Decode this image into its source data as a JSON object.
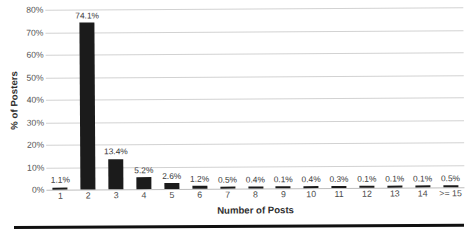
{
  "chart_data": {
    "type": "bar",
    "title": "",
    "xlabel": "Number of Posts",
    "ylabel": "% of Posters",
    "categories": [
      "1",
      "2",
      "3",
      "4",
      "5",
      "6",
      "7",
      "8",
      "9",
      "10",
      "11",
      "12",
      "13",
      "14",
      ">= 15"
    ],
    "values": [
      1.1,
      74.1,
      13.4,
      5.2,
      2.6,
      1.2,
      0.5,
      0.4,
      0.1,
      0.4,
      0.3,
      0.1,
      0.1,
      0.1,
      0.5
    ],
    "data_labels": [
      "1.1%",
      "74.1%",
      "13.4%",
      "5.2%",
      "2.6%",
      "1.2%",
      "0.5%",
      "0.4%",
      "0.1%",
      "0.4%",
      "0.3%",
      "0.1%",
      "0.1%",
      "0.1%",
      "0.5%"
    ],
    "ylim": [
      0,
      80
    ],
    "ytick_values": [
      0,
      10,
      20,
      30,
      40,
      50,
      60,
      70,
      80
    ],
    "ytick_labels": [
      "0%",
      "10%",
      "20%",
      "30%",
      "40%",
      "50%",
      "60%",
      "70%",
      "80%"
    ],
    "grid": true,
    "legend": "none",
    "bar_color": "#1b1b1b",
    "gridline_color": "#d2d2d2",
    "background_color": "#ffffff"
  }
}
